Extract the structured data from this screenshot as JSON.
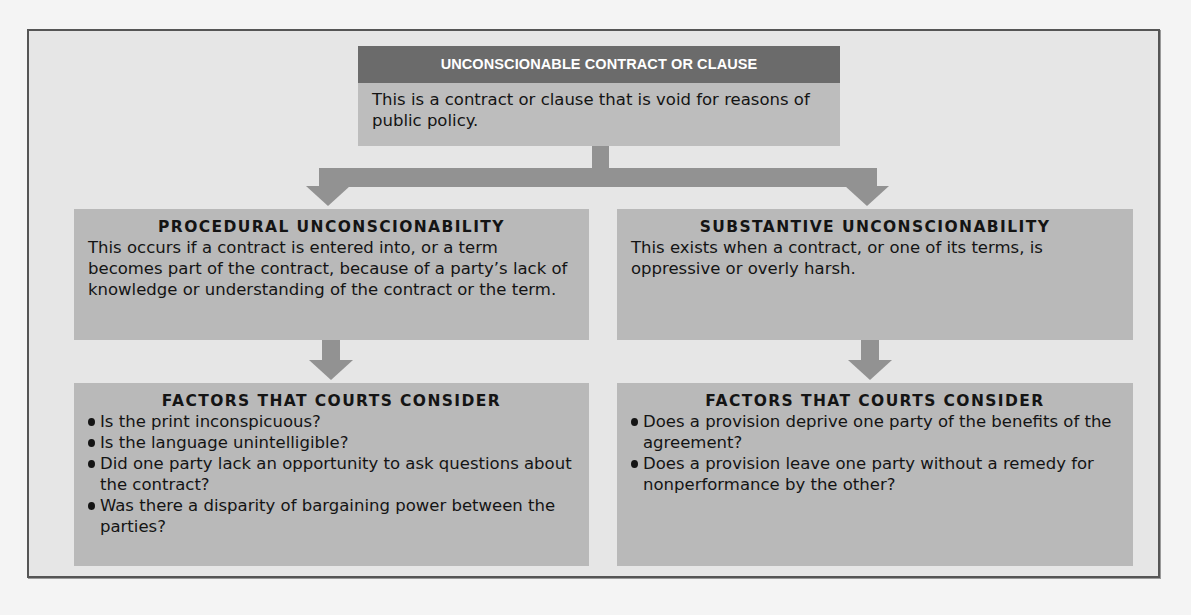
{
  "diagram": {
    "root": {
      "title": "UNCONSCIONABLE CONTRACT OR CLAUSE",
      "description": "This is a contract or clause that is void for reasons of public policy."
    },
    "branches": [
      {
        "title": "PROCEDURAL UNCONSCIONABILITY",
        "description": "This occurs if a contract is entered into, or a term becomes part of the contract, because of a party’s lack of knowledge or understanding of the contract or the term.",
        "factors": {
          "title": "FACTORS THAT COURTS CONSIDER",
          "items": [
            "Is the print inconspicuous?",
            "Is the language unintelligible?",
            "Did one party lack an opportunity to ask questions about the contract?",
            "Was there a disparity of bargaining power between the parties?"
          ]
        }
      },
      {
        "title": "SUBSTANTIVE UNCONSCIONABILITY",
        "description": "This exists when a contract, or one of its terms, is oppressive or overly harsh.",
        "factors": {
          "title": "FACTORS THAT COURTS CONSIDER",
          "items": [
            "Does a provision deprive one party of the benefits of the agreement?",
            "Does a provision leave one party without a remedy for nonperformance by the other?"
          ]
        }
      }
    ],
    "colors": {
      "frame_bg": "#e6e6e6",
      "frame_border": "#555555",
      "root_header": "#6b6b6b",
      "box_fill": "#b9b9b9",
      "connector": "#929292"
    }
  }
}
